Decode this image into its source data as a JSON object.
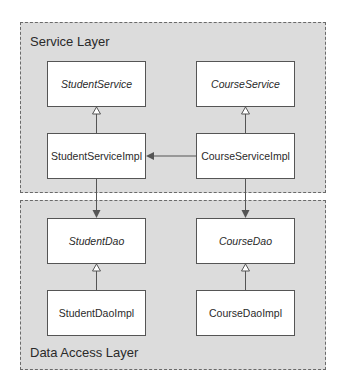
{
  "diagram": {
    "layers": [
      {
        "id": "service",
        "label": "Service Layer"
      },
      {
        "id": "data",
        "label": "Data Access Layer"
      }
    ],
    "boxes": {
      "student_service": {
        "label": "StudentService",
        "kind": "interface"
      },
      "course_service": {
        "label": "CourseService",
        "kind": "interface"
      },
      "student_service_impl": {
        "label": "StudentServiceImpl",
        "kind": "class"
      },
      "course_service_impl": {
        "label": "CourseServiceImpl",
        "kind": "class"
      },
      "student_dao": {
        "label": "StudentDao",
        "kind": "interface"
      },
      "course_dao": {
        "label": "CourseDao",
        "kind": "interface"
      },
      "student_dao_impl": {
        "label": "StudentDaoImpl",
        "kind": "class"
      },
      "course_dao_impl": {
        "label": "CourseDaoImpl",
        "kind": "class"
      }
    },
    "relations": [
      {
        "from": "StudentServiceImpl",
        "to": "StudentService",
        "type": "realization"
      },
      {
        "from": "CourseServiceImpl",
        "to": "CourseService",
        "type": "realization"
      },
      {
        "from": "CourseServiceImpl",
        "to": "StudentServiceImpl",
        "type": "dependency"
      },
      {
        "from": "StudentServiceImpl",
        "to": "StudentDao",
        "type": "dependency"
      },
      {
        "from": "CourseServiceImpl",
        "to": "CourseDao",
        "type": "dependency"
      },
      {
        "from": "StudentDaoImpl",
        "to": "StudentDao",
        "type": "realization"
      },
      {
        "from": "CourseDaoImpl",
        "to": "CourseDao",
        "type": "realization"
      }
    ],
    "colors": {
      "layer_fill": "#dcdcdc",
      "border": "#555555",
      "box_fill": "#ffffff"
    }
  }
}
